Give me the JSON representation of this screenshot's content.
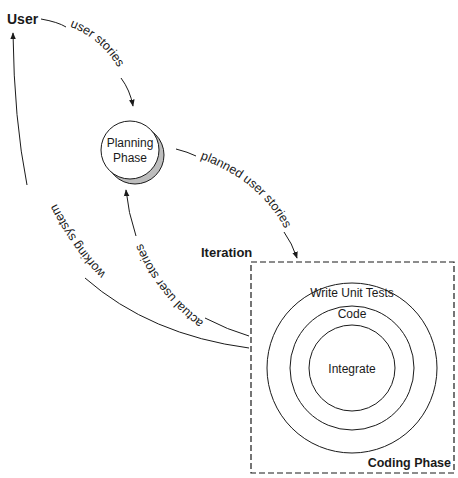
{
  "diagram": {
    "nodes": {
      "user": {
        "label": "User"
      },
      "planning": {
        "line1": "Planning",
        "line2": "Phase"
      },
      "iteration": {
        "label": "Iteration"
      },
      "coding": {
        "label": "Coding Phase"
      },
      "rings": {
        "outer": "Write Unit Tests",
        "middle": "Code",
        "inner": "Integrate"
      }
    },
    "edges": {
      "user_to_planning": "user stories",
      "planning_to_iteration": "planned user stories",
      "iteration_to_planning": "actual user stories",
      "iteration_to_user": "working system"
    },
    "colors": {
      "stroke": "#1a1a1a",
      "shadow": "#bdbdbd",
      "background": "#ffffff"
    }
  }
}
